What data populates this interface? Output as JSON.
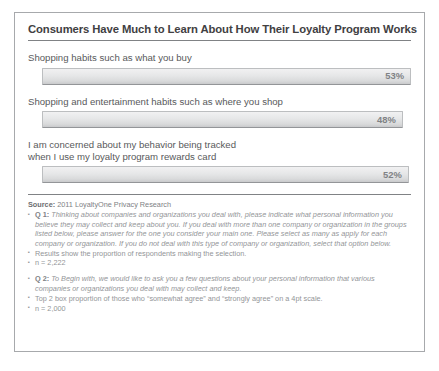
{
  "title": "Consumers Have Much to Learn About How Their Loyalty Program Works",
  "chart_data": {
    "type": "bar",
    "title": "Consumers Have Much to Learn About How Their Loyalty Program Works",
    "xlabel": "",
    "ylabel": "",
    "xlim": [
      0,
      58
    ],
    "grid": false,
    "legend": "none",
    "orientation": "horizontal",
    "value_suffix": "%",
    "categories": [
      "Shopping habits such as what you buy",
      "Shopping and entertainment habits such as where you shop",
      "I am concerned about my behavior being tracked\nwhen I use my loyalty program rewards card"
    ],
    "values": [
      53,
      48,
      52
    ],
    "labels": [
      "53%",
      "48%",
      "52%"
    ]
  },
  "bars": [
    {
      "label": "Shopping habits such as what you buy",
      "value_label": "53%",
      "width_pct": "100%"
    },
    {
      "label": "Shopping and entertainment habits such as where you shop",
      "value_label": "48%",
      "width_pct": "97.8%"
    },
    {
      "label": "I am concerned about my behavior being tracked\nwhen I use my loyalty program rewards card",
      "value_label": "52%",
      "width_pct": "99.4%"
    }
  ],
  "footer": {
    "source_label": "Source:",
    "source_text": "2011 LoyaltyOne Privacy Research",
    "notes": [
      {
        "tag": "Q 1:",
        "text": "Thinking about companies and organizations you deal with, please indicate what personal information you believe they may collect and keep about you. If you deal with more than one company or organization in the groups listed below, please answer for the one you consider your main one. Please select as many as apply for each company or organization. If you do not deal with this type of company or organization, select that option below.",
        "italic": true
      },
      {
        "tag": "",
        "text": "Results show the proportion of respondents making the selection.",
        "italic": false
      },
      {
        "tag": "",
        "text": "n = 2,222",
        "italic": false
      },
      {
        "tag": "Q 2:",
        "text": "To Begin with, we would like to ask you a few questions about your personal information that various companies or organizations you deal with may collect and keep.",
        "italic": true
      },
      {
        "tag": "",
        "text": "Top 2 box proportion of those who “somewhat agree” and “strongly agree” on a 4pt scale.",
        "italic": false
      },
      {
        "tag": "",
        "text": "n = 2,000",
        "italic": false
      }
    ]
  }
}
